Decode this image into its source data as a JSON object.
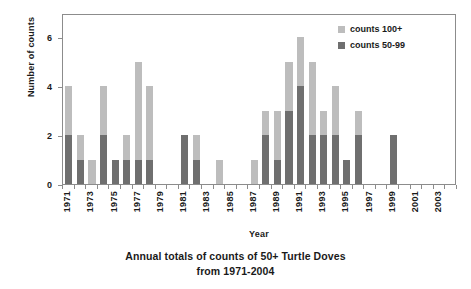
{
  "chart_data": {
    "type": "bar",
    "title": "Annual totals of counts of 50+ Turtle Doves from 1971-2004",
    "title_line1": "Annual totals of counts of 50+ Turtle Doves",
    "title_line2": "from 1971-2004",
    "xlabel": "Year",
    "ylabel": "Number of counts",
    "ylim": [
      0,
      7
    ],
    "yticks": [
      0,
      2,
      4,
      6
    ],
    "grid": false,
    "stacked": true,
    "legend_position": "top-right",
    "categories": [
      "1971",
      "1972",
      "1973",
      "1974",
      "1975",
      "1976",
      "1977",
      "1978",
      "1979",
      "1980",
      "1981",
      "1982",
      "1983",
      "1984",
      "1985",
      "1986",
      "1987",
      "1988",
      "1989",
      "1990",
      "1991",
      "1992",
      "1993",
      "1994",
      "1995",
      "1996",
      "1997",
      "1998",
      "1999",
      "2000",
      "2001",
      "2002",
      "2003",
      "2004"
    ],
    "xtick_labels": [
      "1971",
      "1973",
      "1975",
      "1977",
      "1979",
      "1981",
      "1983",
      "1985",
      "1987",
      "1989",
      "1991",
      "1993",
      "1995",
      "1997",
      "1999",
      "2001",
      "2003"
    ],
    "series": [
      {
        "name": "counts 50-99",
        "color": "#6f6f6f",
        "values": [
          2,
          1,
          0,
          2,
          1,
          1,
          1,
          1,
          0,
          0,
          2,
          1,
          0,
          0,
          0,
          0,
          0,
          2,
          1,
          3,
          4,
          2,
          2,
          2,
          1,
          2,
          0,
          0,
          2,
          0,
          0,
          0,
          0,
          0
        ]
      },
      {
        "name": "counts 100+",
        "color": "#bdbdbd",
        "values": [
          2,
          1,
          1,
          2,
          0,
          1,
          4,
          3,
          0,
          0,
          0,
          1,
          0,
          1,
          0,
          0,
          1,
          1,
          2,
          2,
          2,
          3,
          1,
          2,
          0,
          1,
          0,
          0,
          0,
          0,
          0,
          0,
          0,
          0
        ]
      }
    ],
    "totals": [
      4,
      2,
      1,
      4,
      1,
      2,
      5,
      4,
      0,
      0,
      2,
      2,
      0,
      1,
      0,
      0,
      1,
      3,
      3,
      5,
      6,
      5,
      3,
      4,
      1,
      3,
      0,
      0,
      2,
      0,
      0,
      0,
      0,
      0
    ]
  },
  "legend": {
    "items": [
      {
        "label": "counts 100+",
        "color": "#bdbdbd"
      },
      {
        "label": "counts 50-99",
        "color": "#6f6f6f"
      }
    ]
  },
  "colors": {
    "counts_100_plus": "#bdbdbd",
    "counts_50_99": "#6f6f6f",
    "axis": "#8c8c8c",
    "text": "#1a1a1a",
    "background": "#ffffff"
  }
}
